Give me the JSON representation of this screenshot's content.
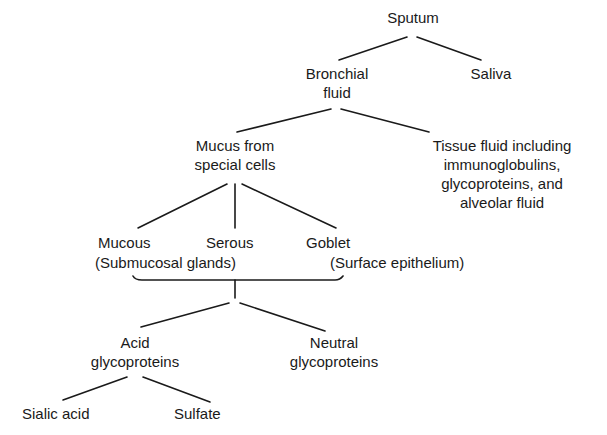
{
  "diagram": {
    "nodes": {
      "sputum": {
        "lines": [
          "Sputum"
        ]
      },
      "saliva": {
        "lines": [
          "Saliva"
        ]
      },
      "bronchial_fluid": {
        "lines": [
          "Bronchial",
          "fluid"
        ]
      },
      "mucus_special_cells": {
        "lines": [
          "Mucus from",
          "special cells"
        ]
      },
      "tissue_fluid": {
        "lines": [
          "Tissue fluid including",
          "immunoglobulins,",
          "glycoproteins, and",
          "alveolar fluid"
        ]
      },
      "mucous": {
        "lines": [
          "Mucous"
        ]
      },
      "serous": {
        "lines": [
          "Serous"
        ]
      },
      "goblet": {
        "lines": [
          "Goblet"
        ]
      },
      "submucosal_glands": {
        "lines": [
          "(Submucosal glands)"
        ]
      },
      "surface_epithelium": {
        "lines": [
          "(Surface epithelium)"
        ]
      },
      "acid_glycoproteins": {
        "lines": [
          "Acid",
          "glycoproteins"
        ]
      },
      "neutral_glycoproteins": {
        "lines": [
          "Neutral",
          "glycoproteins"
        ]
      },
      "sialic_acid": {
        "lines": [
          "Sialic acid"
        ]
      },
      "sulfate": {
        "lines": [
          "Sulfate"
        ]
      }
    },
    "edges": [
      [
        "sputum",
        "bronchial_fluid"
      ],
      [
        "sputum",
        "saliva"
      ],
      [
        "bronchial_fluid",
        "mucus_special_cells"
      ],
      [
        "bronchial_fluid",
        "tissue_fluid"
      ],
      [
        "mucus_special_cells",
        "mucous"
      ],
      [
        "mucus_special_cells",
        "serous"
      ],
      [
        "mucus_special_cells",
        "goblet"
      ],
      [
        "mucous+serous+goblet",
        "acid_glycoproteins"
      ],
      [
        "mucous+serous+goblet",
        "neutral_glycoproteins"
      ],
      [
        "acid_glycoproteins",
        "sialic_acid"
      ],
      [
        "acid_glycoproteins",
        "sulfate"
      ]
    ]
  }
}
